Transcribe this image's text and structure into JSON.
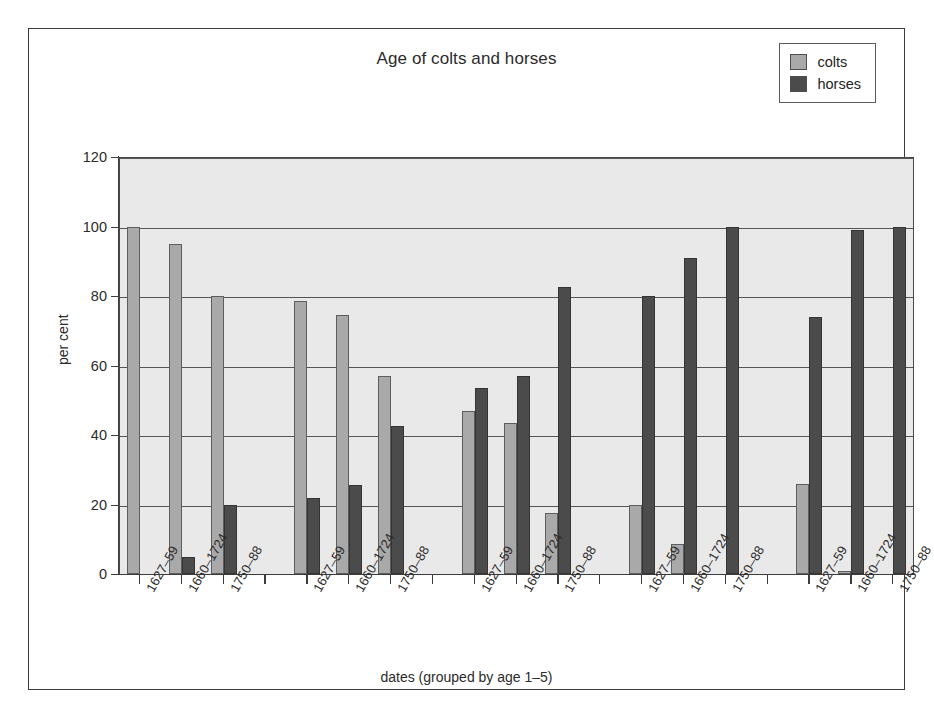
{
  "chart_data": {
    "type": "bar",
    "title": "Age of colts and horses",
    "xlabel": "dates (grouped by age 1–5)",
    "ylabel": "per cent",
    "ylim": [
      0,
      120
    ],
    "ytick_values": [
      0,
      20,
      40,
      60,
      80,
      100,
      120
    ],
    "ytick_labels": [
      "0",
      "20",
      "40",
      "60",
      "80",
      "100",
      "120"
    ],
    "grid": true,
    "legend_position": "top-right",
    "categories": [
      "1627–59",
      "1660–1724",
      "1750–88",
      "1627–59",
      "1660–1724",
      "1750–88",
      "1627–59",
      "1660–1724",
      "1750–88",
      "1627–59",
      "1660–1724",
      "1750–88",
      "1627–59",
      "1660–1724",
      "1750–88"
    ],
    "groups": [
      {
        "age": "1",
        "categories": [
          "1627–59",
          "1660–1724",
          "1750–88"
        ],
        "colts": [
          100,
          95,
          80
        ],
        "horses": [
          0,
          5,
          20
        ]
      },
      {
        "age": "2",
        "categories": [
          "1627–59",
          "1660–1724",
          "1750–88"
        ],
        "colts": [
          78.5,
          74.5,
          57
        ],
        "horses": [
          22,
          25.5,
          42.5
        ]
      },
      {
        "age": "3",
        "categories": [
          "1627–59",
          "1660–1724",
          "1750–88"
        ],
        "colts": [
          47,
          43.5,
          17.5
        ],
        "horses": [
          53.5,
          57,
          82.5
        ]
      },
      {
        "age": "4",
        "categories": [
          "1627–59",
          "1660–1724",
          "1750–88"
        ],
        "colts": [
          20,
          8.5,
          0
        ],
        "horses": [
          80,
          91,
          100
        ]
      },
      {
        "age": "5",
        "categories": [
          "1627–59",
          "1660–1724",
          "1750–88"
        ],
        "colts": [
          26,
          1,
          0
        ],
        "horses": [
          74,
          99,
          100
        ]
      }
    ],
    "series": [
      {
        "name": "colts",
        "color": "#a9a9a9",
        "values": [
          100,
          95,
          80,
          78.5,
          74.5,
          57,
          47,
          43.5,
          17.5,
          20,
          8.5,
          0,
          26,
          1,
          0
        ]
      },
      {
        "name": "horses",
        "color": "#4b4b4b",
        "values": [
          0,
          5,
          20,
          22,
          25.5,
          42.5,
          53.5,
          57,
          82.5,
          80,
          91,
          100,
          74,
          99,
          100
        ]
      }
    ]
  },
  "legend": {
    "items": [
      {
        "label": "colts",
        "color": "#a9a9a9"
      },
      {
        "label": "horses",
        "color": "#4b4b4b"
      }
    ]
  }
}
